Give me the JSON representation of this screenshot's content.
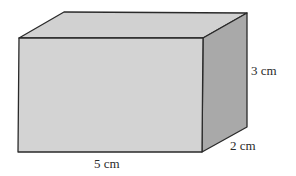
{
  "figure": {
    "type": "rectangular-prism",
    "labels": {
      "length": "5 cm",
      "height": "3 cm",
      "depth": "2 cm"
    },
    "dimensions_cm": {
      "length": 5,
      "height": 3,
      "depth": 2
    },
    "colors": {
      "front_face": "#d3d3d3",
      "top_face": "#d1d1d1",
      "side_face": "#a9a9a9",
      "edge": "#2a2a2a",
      "text": "#2a2a2a"
    }
  }
}
